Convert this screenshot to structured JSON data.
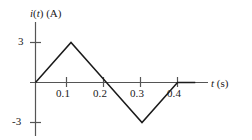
{
  "figure": {
    "background_color": "#ffffff",
    "line_color": "#1a1a1a",
    "axis_color": "#4d4d4d"
  },
  "axes": {
    "y_title": "i(t) (A)",
    "y_title_var": "i",
    "y_title_arg": "t",
    "x_title": "t (s)",
    "x_title_var": "t",
    "x_title_unit": "(s)",
    "y_ticks": [
      "3",
      "-3"
    ],
    "x_ticks": [
      "0.1",
      "0.2",
      "0.3",
      "0.4"
    ]
  },
  "chart_data": {
    "type": "line",
    "title": "",
    "subtitle": "",
    "xlabel": "t (s)",
    "ylabel": "i(t) (A)",
    "xlim": [
      0,
      0.45
    ],
    "ylim": [
      -3.6,
      3.6
    ],
    "grid": false,
    "legend": false,
    "x_tick_values": [
      0.1,
      0.2,
      0.3,
      0.4
    ],
    "x_tick_labels": [
      "0.1",
      "0.2",
      "0.3",
      "0.4"
    ],
    "y_tick_values": [
      3,
      -3
    ],
    "y_tick_labels": [
      "3",
      "-3"
    ],
    "series": [
      {
        "name": "i(t)",
        "x": [
          0,
          0.1,
          0.2,
          0.3,
          0.4,
          0.45
        ],
        "values": [
          0,
          3,
          0,
          -3,
          0,
          0
        ]
      }
    ],
    "annotations": []
  }
}
